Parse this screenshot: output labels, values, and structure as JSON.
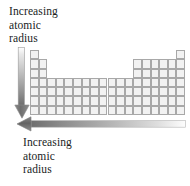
{
  "figure": {
    "captions": {
      "top": {
        "name": "increasing-atomic-radius-down",
        "lines": [
          "Increasing",
          "atomic",
          "radius"
        ]
      },
      "bottom": {
        "name": "increasing-atomic-radius-left",
        "lines": [
          "Increasing",
          "atomic",
          "radius"
        ]
      }
    },
    "arrows": {
      "vertical": {
        "name": "down-arrow",
        "direction": "down",
        "gradient_from": "#ffffff",
        "gradient_to": "#6b6b6b"
      },
      "horizontal": {
        "name": "left-arrow",
        "direction": "left",
        "gradient_from": "#6b6b6b",
        "gradient_to": "#fdfdfd"
      }
    },
    "periodic_table": {
      "name": "periodic-table-outline",
      "columns": 18,
      "rows": 7,
      "cell_fill": "#f2f2f2",
      "cell_border": "#a8a8a8",
      "filled_cells": [
        [
          1,
          1
        ],
        [
          1,
          18
        ],
        [
          2,
          1
        ],
        [
          2,
          2
        ],
        [
          2,
          13
        ],
        [
          2,
          14
        ],
        [
          2,
          15
        ],
        [
          2,
          16
        ],
        [
          2,
          17
        ],
        [
          2,
          18
        ],
        [
          3,
          1
        ],
        [
          3,
          2
        ],
        [
          3,
          13
        ],
        [
          3,
          14
        ],
        [
          3,
          15
        ],
        [
          3,
          16
        ],
        [
          3,
          17
        ],
        [
          3,
          18
        ],
        [
          4,
          1
        ],
        [
          4,
          2
        ],
        [
          4,
          3
        ],
        [
          4,
          4
        ],
        [
          4,
          5
        ],
        [
          4,
          6
        ],
        [
          4,
          7
        ],
        [
          4,
          8
        ],
        [
          4,
          9
        ],
        [
          4,
          10
        ],
        [
          4,
          11
        ],
        [
          4,
          12
        ],
        [
          4,
          13
        ],
        [
          4,
          14
        ],
        [
          4,
          15
        ],
        [
          4,
          16
        ],
        [
          4,
          17
        ],
        [
          4,
          18
        ],
        [
          5,
          1
        ],
        [
          5,
          2
        ],
        [
          5,
          3
        ],
        [
          5,
          4
        ],
        [
          5,
          5
        ],
        [
          5,
          6
        ],
        [
          5,
          7
        ],
        [
          5,
          8
        ],
        [
          5,
          9
        ],
        [
          5,
          10
        ],
        [
          5,
          11
        ],
        [
          5,
          12
        ],
        [
          5,
          13
        ],
        [
          5,
          14
        ],
        [
          5,
          15
        ],
        [
          5,
          16
        ],
        [
          5,
          17
        ],
        [
          5,
          18
        ],
        [
          6,
          1
        ],
        [
          6,
          2
        ],
        [
          6,
          3
        ],
        [
          6,
          4
        ],
        [
          6,
          5
        ],
        [
          6,
          6
        ],
        [
          6,
          7
        ],
        [
          6,
          8
        ],
        [
          6,
          9
        ],
        [
          6,
          10
        ],
        [
          6,
          11
        ],
        [
          6,
          12
        ],
        [
          6,
          13
        ],
        [
          6,
          14
        ],
        [
          6,
          15
        ],
        [
          6,
          16
        ],
        [
          6,
          17
        ],
        [
          6,
          18
        ],
        [
          7,
          1
        ],
        [
          7,
          2
        ],
        [
          7,
          3
        ],
        [
          7,
          4
        ],
        [
          7,
          5
        ],
        [
          7,
          6
        ],
        [
          7,
          7
        ],
        [
          7,
          8
        ],
        [
          7,
          9
        ],
        [
          7,
          10
        ],
        [
          7,
          11
        ],
        [
          7,
          12
        ],
        [
          7,
          13
        ],
        [
          7,
          14
        ],
        [
          7,
          15
        ],
        [
          7,
          16
        ],
        [
          7,
          17
        ],
        [
          7,
          18
        ]
      ]
    }
  }
}
